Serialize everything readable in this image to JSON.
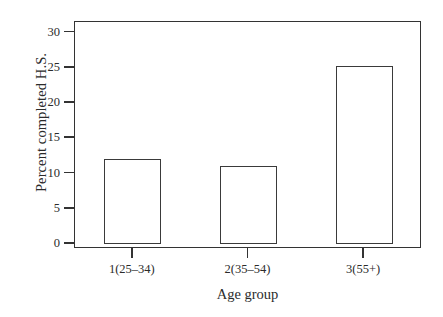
{
  "chart_data": {
    "type": "bar",
    "title": "",
    "xlabel": "Age group",
    "ylabel": "Percent completed H.S.",
    "categories": [
      "1(25–34)",
      "2(35–54)",
      "3(55+)"
    ],
    "values": [
      12.0,
      11.0,
      25.2
    ],
    "ylim": [
      0,
      31.5
    ],
    "yticks": [
      0,
      5,
      10,
      15,
      20,
      25,
      30
    ],
    "ytick_labels": [
      "0",
      "5",
      "10",
      "15",
      "20",
      "25",
      "30"
    ],
    "grid": false,
    "legend": null,
    "bar_style": {
      "fill": "#ffffff",
      "edge": "#3a3a3a"
    },
    "frame": {
      "color": "#333333",
      "box": true
    }
  }
}
